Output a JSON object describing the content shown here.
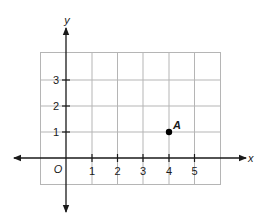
{
  "figure": {
    "type": "coordinate-plane",
    "axis_labels": {
      "x": "x",
      "y": "y"
    },
    "origin_label": "O",
    "x_tick_labels": [
      "1",
      "2",
      "3",
      "4",
      "5"
    ],
    "y_tick_labels": [
      "1",
      "2",
      "3"
    ],
    "grid": {
      "x_range": [
        -1,
        6
      ],
      "y_range": [
        -1,
        4
      ]
    },
    "points": [
      {
        "label": "A",
        "x": 4,
        "y": 1
      }
    ],
    "colors": {
      "grid": "#b5b5b5",
      "axis": "#1a1a1a",
      "point": "#000000"
    }
  }
}
